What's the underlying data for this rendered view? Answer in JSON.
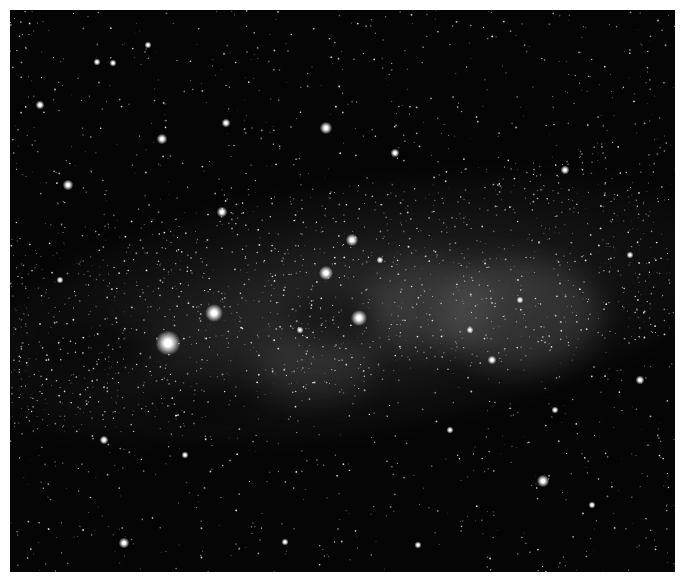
{
  "image": {
    "subject": "Milky Way star field",
    "colors": {
      "sky": "#050505",
      "band": "#7a7a7a",
      "star": "#ffffff",
      "border": "#ffffff"
    }
  },
  "bright_stars": [
    {
      "x": 168,
      "y": 343,
      "r": 7
    },
    {
      "x": 214,
      "y": 313,
      "r": 5
    },
    {
      "x": 359,
      "y": 318,
      "r": 4.5
    },
    {
      "x": 326,
      "y": 273,
      "r": 4
    },
    {
      "x": 352,
      "y": 240,
      "r": 3.5
    },
    {
      "x": 326,
      "y": 128,
      "r": 3.5
    },
    {
      "x": 543,
      "y": 481,
      "r": 3.5
    },
    {
      "x": 124,
      "y": 543,
      "r": 3
    },
    {
      "x": 68,
      "y": 185,
      "r": 3
    },
    {
      "x": 162,
      "y": 139,
      "r": 3
    },
    {
      "x": 222,
      "y": 212,
      "r": 3
    },
    {
      "x": 395,
      "y": 153,
      "r": 2.5
    },
    {
      "x": 565,
      "y": 170,
      "r": 2.5
    },
    {
      "x": 492,
      "y": 360,
      "r": 2.5
    },
    {
      "x": 40,
      "y": 105,
      "r": 2.5
    },
    {
      "x": 104,
      "y": 440,
      "r": 2.5
    },
    {
      "x": 226,
      "y": 123,
      "r": 2.5
    },
    {
      "x": 640,
      "y": 380,
      "r": 2.5
    },
    {
      "x": 148,
      "y": 45,
      "r": 2
    },
    {
      "x": 113,
      "y": 63,
      "r": 2
    },
    {
      "x": 97,
      "y": 62,
      "r": 2
    },
    {
      "x": 285,
      "y": 542,
      "r": 2
    },
    {
      "x": 418,
      "y": 545,
      "r": 2
    },
    {
      "x": 592,
      "y": 505,
      "r": 2
    },
    {
      "x": 630,
      "y": 255,
      "r": 2
    },
    {
      "x": 520,
      "y": 300,
      "r": 2
    },
    {
      "x": 470,
      "y": 330,
      "r": 2
    },
    {
      "x": 380,
      "y": 260,
      "r": 2
    },
    {
      "x": 300,
      "y": 330,
      "r": 2
    },
    {
      "x": 185,
      "y": 455,
      "r": 2
    },
    {
      "x": 60,
      "y": 280,
      "r": 2
    },
    {
      "x": 450,
      "y": 430,
      "r": 2
    },
    {
      "x": 555,
      "y": 410,
      "r": 2
    }
  ],
  "clusters": [
    {
      "x": 505,
      "y": 300,
      "r": 60
    },
    {
      "x": 420,
      "y": 290,
      "r": 55
    },
    {
      "x": 300,
      "y": 345,
      "r": 40
    }
  ]
}
